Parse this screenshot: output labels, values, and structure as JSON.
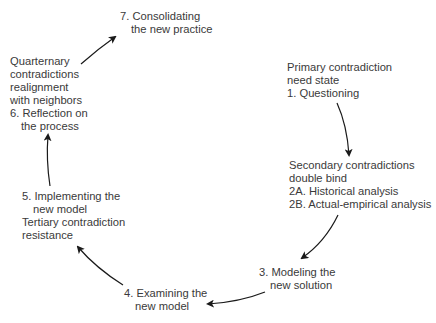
{
  "diagram": {
    "type": "cycle",
    "text_color": "#3a3a3a",
    "arrow_color": "#1a1a1a",
    "nodes": {
      "n7": {
        "lines": [
          "7. Consolidating",
          "the new practice"
        ]
      },
      "n6": {
        "lines": [
          "Quarternary",
          "contradictions",
          "realignment",
          "with neighbors",
          "6. Reflection on",
          "the process"
        ]
      },
      "n1": {
        "lines": [
          "Primary contradiction",
          "need state",
          "1. Questioning"
        ]
      },
      "n2": {
        "lines": [
          "Secondary contradictions",
          "double bind",
          "2A. Historical analysis",
          "2B. Actual-empirical analysis"
        ]
      },
      "n5": {
        "lines": [
          "5. Implementing the",
          "new model",
          "Tertiary contradiction",
          "resistance"
        ]
      },
      "n3": {
        "lines": [
          "3. Modeling the",
          "new solution"
        ]
      },
      "n4": {
        "lines": [
          "4. Examining the",
          "new model"
        ]
      }
    },
    "edges": [
      {
        "from": "n1",
        "to": "n2"
      },
      {
        "from": "n2",
        "to": "n3"
      },
      {
        "from": "n3",
        "to": "n4"
      },
      {
        "from": "n4",
        "to": "n5"
      },
      {
        "from": "n5",
        "to": "n6"
      },
      {
        "from": "n6",
        "to": "n7"
      }
    ]
  }
}
